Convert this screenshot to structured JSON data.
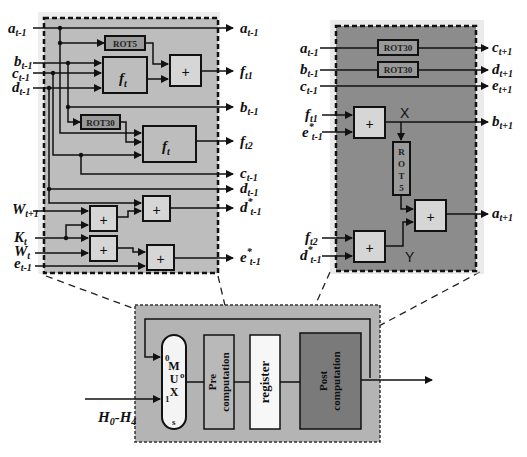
{
  "colors": {
    "left_panel_bg": "#bdbdbd",
    "right_panel_bg": "#8c8c8c",
    "bottom_panel_bg": "#b4b4b4",
    "block_light": "#d6d6d6",
    "rot_block": "#9a9a9a",
    "post_block": "#7a7a7a",
    "register_block": "#f7f7f7",
    "wire": "#111111"
  },
  "left_panel": {
    "inputs": [
      {
        "base": "a",
        "sub": "t-1",
        "sup": ""
      },
      {
        "base": "b",
        "sub": "t-1",
        "sup": ""
      },
      {
        "base": "c",
        "sub": "t-1",
        "sup": ""
      },
      {
        "base": "d",
        "sub": "t-1",
        "sup": ""
      },
      {
        "base": "W",
        "sub": "t+1",
        "sup": ""
      },
      {
        "base": "K",
        "sub": "t",
        "sup": ""
      },
      {
        "base": "W",
        "sub": "t",
        "sup": ""
      },
      {
        "base": "e",
        "sub": "t-1",
        "sup": ""
      }
    ],
    "outputs": [
      {
        "base": "a",
        "sub": "t-1",
        "sup": ""
      },
      {
        "base": "f",
        "sub": "t1",
        "sup": ""
      },
      {
        "base": "b",
        "sub": "t-1",
        "sup": ""
      },
      {
        "base": "f",
        "sub": "t2",
        "sup": ""
      },
      {
        "base": "c",
        "sub": "t-1",
        "sup": ""
      },
      {
        "base": "d",
        "sub": "t-1",
        "sup": ""
      },
      {
        "base": "d",
        "sub": "t-1",
        "sup": "*"
      },
      {
        "base": "e",
        "sub": "t-1",
        "sup": "*"
      }
    ],
    "blocks": {
      "rot5": "ROT5",
      "rot30": "ROT30",
      "ft_base": "f",
      "ft_sub": "t",
      "adder": "+"
    }
  },
  "right_panel": {
    "inputs": [
      {
        "base": "a",
        "sub": "t-1",
        "sup": ""
      },
      {
        "base": "b",
        "sub": "t-1",
        "sup": ""
      },
      {
        "base": "c",
        "sub": "t-1",
        "sup": ""
      },
      {
        "base": "f",
        "sub": "t1",
        "sup": ""
      },
      {
        "base": "e",
        "sub": "t-1",
        "sup": "*"
      },
      {
        "base": "f",
        "sub": "t2",
        "sup": ""
      },
      {
        "base": "d",
        "sub": "t-1",
        "sup": "*"
      }
    ],
    "outputs": [
      {
        "base": "c",
        "sub": "t+1",
        "sup": ""
      },
      {
        "base": "d",
        "sub": "t+1",
        "sup": ""
      },
      {
        "base": "e",
        "sub": "t+1",
        "sup": ""
      },
      {
        "base": "b",
        "sub": "t+1",
        "sup": ""
      },
      {
        "base": "a",
        "sub": "t+1",
        "sup": ""
      }
    ],
    "blocks": {
      "rot30_1": "ROT30",
      "rot30_2": "ROT30",
      "rot5_vertical": [
        "R",
        "O",
        "T",
        "5"
      ],
      "adder": "+",
      "node_x": "X",
      "node_y": "Y"
    }
  },
  "bottom_panel": {
    "mux_letters": [
      "M",
      "U",
      "X"
    ],
    "mux_port_0": "0",
    "mux_port_1": "1",
    "mux_port_o": "o",
    "mux_port_s": "s",
    "pre_label": [
      "Pre",
      "computation"
    ],
    "register_label": "register",
    "post_label": [
      "Post",
      "computation"
    ],
    "input_label": {
      "base1": "H",
      "sub1": "0",
      "sep": "-",
      "base2": "H",
      "sub2": "4"
    }
  }
}
